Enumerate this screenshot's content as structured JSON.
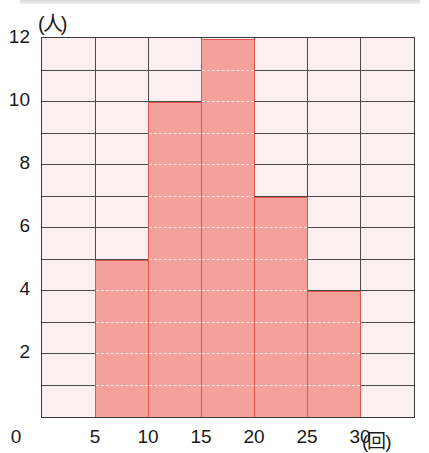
{
  "chart_data": {
    "type": "bar",
    "subtype": "histogram",
    "title": "",
    "xlabel": "(回)",
    "ylabel": "(人)",
    "bin_edges": [
      0,
      5,
      10,
      15,
      20,
      25,
      30,
      35
    ],
    "categories": [
      "0-5",
      "5-10",
      "10-15",
      "15-20",
      "20-25",
      "25-30",
      "30-35"
    ],
    "values": [
      0,
      5,
      10,
      12,
      7,
      4,
      0
    ],
    "x_ticks": [
      "0",
      "5",
      "10",
      "15",
      "20",
      "25",
      "30"
    ],
    "y_ticks": [
      "2",
      "4",
      "6",
      "8",
      "10",
      "12"
    ],
    "xlim": [
      0,
      35
    ],
    "ylim": [
      0,
      12
    ],
    "grid": true,
    "grid_rows": 12,
    "legend": null
  },
  "colors": {
    "bar_fill": "#f4a19c",
    "bar_edge": "#e0564e",
    "cell_background": "#fbeff0",
    "grid": "#4a4a4a"
  }
}
